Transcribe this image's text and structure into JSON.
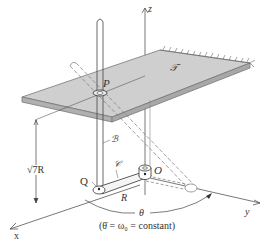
{
  "figure": {
    "axes": {
      "x": "x",
      "y": "y",
      "z": "z"
    },
    "labels": {
      "plate": "𝒯",
      "point_p": "P",
      "rod": "ℬ",
      "arm": "𝒞",
      "point_q": "Q",
      "origin": "O",
      "arm_length": "R",
      "height": "√7R",
      "angle": "θ",
      "condition": "(θ̇ = ω₀ = constant)"
    },
    "colors": {
      "line": "#333333",
      "plate_fill": "#c8c8c8",
      "plate_edge": "#9a9a9a",
      "background": "#ffffff"
    }
  }
}
